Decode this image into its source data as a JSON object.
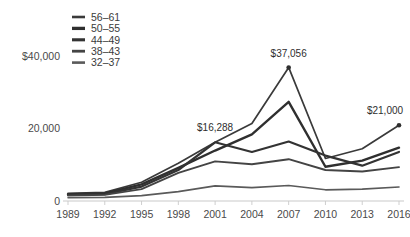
{
  "chart_data": {
    "type": "line",
    "title": "",
    "subtitle": "",
    "xlabel": "",
    "ylabel": "",
    "grid": false,
    "legend_position": "top-left",
    "x": [
      1989,
      1992,
      1995,
      1998,
      2001,
      2004,
      2007,
      2010,
      2013,
      2016
    ],
    "xtick_labels": [
      "1989",
      "1992",
      "1995",
      "1998",
      "2001",
      "2004",
      "2007",
      "2010",
      "2013",
      "2016"
    ],
    "ytick_labels": [
      "$40,000",
      "20,000",
      "0"
    ],
    "ytick_values": [
      40000,
      20000,
      0
    ],
    "ylim": [
      0,
      43000
    ],
    "xlim": [
      1989,
      2016
    ],
    "series": [
      {
        "name": "56–61",
        "stroke": "#3a3a3a",
        "width": 1.7,
        "values": [
          2100,
          2400,
          5200,
          10500,
          16288,
          21500,
          37056,
          11800,
          14500,
          21000
        ]
      },
      {
        "name": "50–55",
        "stroke": "#2f2f2f",
        "width": 2.4,
        "values": [
          1900,
          2100,
          4600,
          9200,
          14000,
          18500,
          27500,
          9500,
          11200,
          14800
        ]
      },
      {
        "name": "44–49",
        "stroke": "#333333",
        "width": 2.2,
        "values": [
          1700,
          1900,
          4000,
          8600,
          16288,
          13600,
          16500,
          12600,
          9800,
          13600
        ]
      },
      {
        "name": "38–43",
        "stroke": "#444444",
        "width": 1.9,
        "values": [
          1500,
          1700,
          3300,
          7800,
          11000,
          10200,
          11600,
          8600,
          8200,
          9400
        ]
      },
      {
        "name": "32–37",
        "stroke": "#5a5a5a",
        "width": 1.6,
        "values": [
          900,
          1000,
          1500,
          2600,
          4200,
          3700,
          4300,
          3100,
          3300,
          3900
        ]
      }
    ],
    "annotations": [
      {
        "label": "$16,288",
        "x": 2001,
        "y": 16288,
        "dx": 0,
        "dy": -11,
        "dot": false
      },
      {
        "label": "$37,056",
        "x": 2007,
        "y": 37056,
        "dx": 0,
        "dy": -10,
        "dot": true
      },
      {
        "label": "$21,000",
        "x": 2016,
        "y": 21000,
        "dx": -14,
        "dy": -11,
        "dot": true
      }
    ]
  }
}
